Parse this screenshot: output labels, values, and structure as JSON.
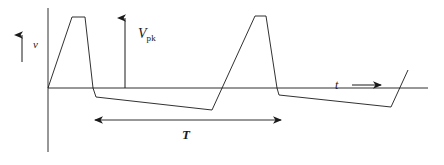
{
  "figure": {
    "background_color": "#ffffff",
    "stroke_color": "#1a1a1a",
    "labels": {
      "voltage_axis": "v",
      "peak_voltage": "V",
      "peak_voltage_subscript": "pk",
      "period": "T",
      "time_axis": "t"
    },
    "axes": {
      "vertical": {
        "x": 48,
        "y_top": 8,
        "y_bottom": 152
      },
      "horizontal": {
        "y": 88,
        "x_left": 48,
        "x_right": 428
      }
    },
    "annotations": {
      "v_arrow": {
        "x": 22,
        "y_tail": 62,
        "y_head": 33,
        "direction": "up"
      },
      "vpk_arrow": {
        "x": 125,
        "y_tail": 88,
        "y_head": 16,
        "direction": "up"
      },
      "period_arrow": {
        "y": 120,
        "x_left": 95,
        "x_right": 281,
        "direction": "both"
      },
      "t_arrow": {
        "y": 85,
        "x_tail": 352,
        "x_head": 382,
        "direction": "right"
      }
    }
  },
  "chart_data": {
    "type": "line",
    "xlabel": "t",
    "ylabel": "v",
    "grid": false,
    "legend": null,
    "xlim": [
      48,
      428
    ],
    "ylim": [
      152,
      8
    ],
    "annotations": [
      {
        "text": "v",
        "kind": "axis-label",
        "x": 33,
        "y": 44
      },
      {
        "text": "V_pk",
        "kind": "amplitude-marker",
        "x": 138,
        "y": 34
      },
      {
        "text": "T",
        "kind": "period-marker",
        "x": 182,
        "y": 134
      },
      {
        "text": "t",
        "kind": "axis-label",
        "x": 335,
        "y": 85
      }
    ],
    "series": [
      {
        "name": "waveform",
        "points": [
          [
            48,
            88
          ],
          [
            72,
            17
          ],
          [
            85,
            17
          ],
          [
            93,
            88
          ],
          [
            96,
            97
          ],
          [
            212,
            110
          ],
          [
            255,
            16
          ],
          [
            266,
            16
          ],
          [
            277,
            88
          ],
          [
            279,
            95
          ],
          [
            391,
            107
          ],
          [
            408,
            70
          ]
        ]
      }
    ],
    "zero_line_y": 88
  }
}
